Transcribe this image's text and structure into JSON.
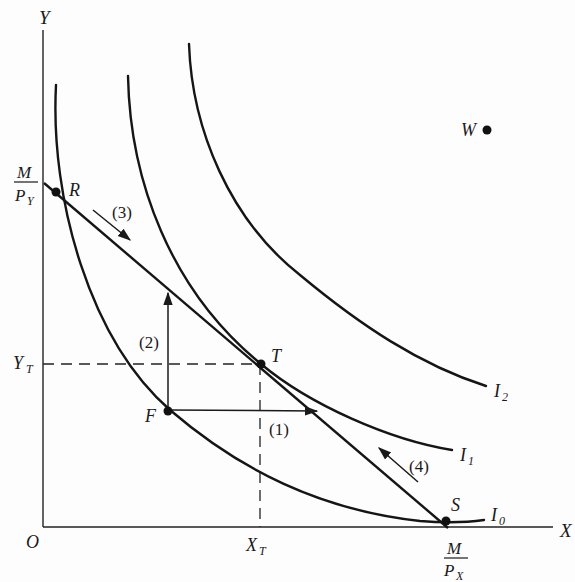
{
  "axes": {
    "x_label": "X",
    "y_label": "Y",
    "origin_label": "O"
  },
  "intercepts": {
    "y_intercept": {
      "numerator": "M",
      "denominator": "P",
      "sub": "Y"
    },
    "x_intercept": {
      "numerator": "M",
      "denominator": "P",
      "sub": "X"
    }
  },
  "optimum": {
    "x_label": "X",
    "x_sub": "T",
    "y_label": "Y",
    "y_sub": "T"
  },
  "points": {
    "R": "R",
    "T": "T",
    "F": "F",
    "S": "S",
    "W": "W"
  },
  "curves": {
    "I0": {
      "label": "I",
      "sub": "0"
    },
    "I1": {
      "label": "I",
      "sub": "1"
    },
    "I2": {
      "label": "I",
      "sub": "2"
    }
  },
  "arrows": {
    "a1": "(1)",
    "a2": "(2)",
    "a3": "(3)",
    "a4": "(4)"
  },
  "colors": {
    "ink": "#151515",
    "background": "#fdfdfd"
  }
}
